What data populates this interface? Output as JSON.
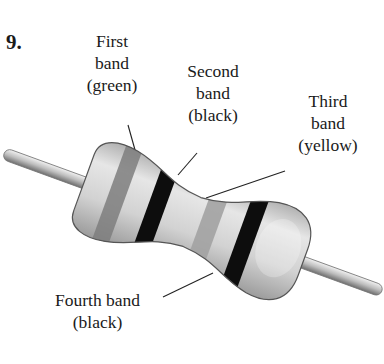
{
  "problem_number": "9.",
  "labels": {
    "first": {
      "line1": "First",
      "line2": "band",
      "line3": "(green)"
    },
    "second": {
      "line1": "Second",
      "line2": "band",
      "line3": "(black)"
    },
    "third": {
      "line1": "Third",
      "line2": "band",
      "line3": "(yellow)"
    },
    "fourth": {
      "line1": "Fourth band",
      "line2": "(black)"
    }
  },
  "bands": [
    {
      "position": 1,
      "color_name": "green",
      "render_color": "#8a8a8a"
    },
    {
      "position": 2,
      "color_name": "black",
      "render_color": "#0d0d0d"
    },
    {
      "position": 3,
      "color_name": "yellow",
      "render_color": "#a9a9a9"
    },
    {
      "position": 4,
      "color_name": "black",
      "render_color": "#0d0d0d"
    }
  ]
}
